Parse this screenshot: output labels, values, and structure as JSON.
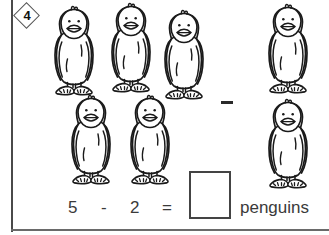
{
  "worksheet": {
    "problem_number": "4",
    "badge_icon": "diamond-badge",
    "subject_noun": "penguins",
    "operation": "subtraction"
  },
  "equation": {
    "minuend": "5",
    "operator": "-",
    "subtrahend": "2",
    "equals": "=",
    "answer_value": "",
    "answer_placeholder": "",
    "unit_label": "penguins"
  },
  "groups": {
    "minuend_group": {
      "name": "left-penguin-group",
      "count": 5,
      "items": [
        {
          "icon": "penguin-icon",
          "x": 48,
          "y": 4,
          "w": 52,
          "h": 94
        },
        {
          "icon": "penguin-icon",
          "x": 105,
          "y": 1,
          "w": 52,
          "h": 94
        },
        {
          "icon": "penguin-icon",
          "x": 158,
          "y": 8,
          "w": 52,
          "h": 94
        },
        {
          "icon": "penguin-icon",
          "x": 65,
          "y": 93,
          "w": 52,
          "h": 94
        },
        {
          "icon": "penguin-icon",
          "x": 124,
          "y": 93,
          "w": 52,
          "h": 94
        }
      ]
    },
    "subtrahend_group": {
      "name": "right-penguin-group",
      "count": 2,
      "items": [
        {
          "icon": "penguin-icon",
          "x": 262,
          "y": 2,
          "w": 52,
          "h": 94
        },
        {
          "icon": "penguin-icon",
          "x": 262,
          "y": 97,
          "w": 52,
          "h": 94
        }
      ]
    }
  },
  "separator": {
    "icon": "minus-sign-icon",
    "symbol": "-"
  },
  "colors": {
    "ink": "#111111",
    "rule": "#4a4a4a",
    "text": "#3a3a3a",
    "page": "#ffffff"
  }
}
